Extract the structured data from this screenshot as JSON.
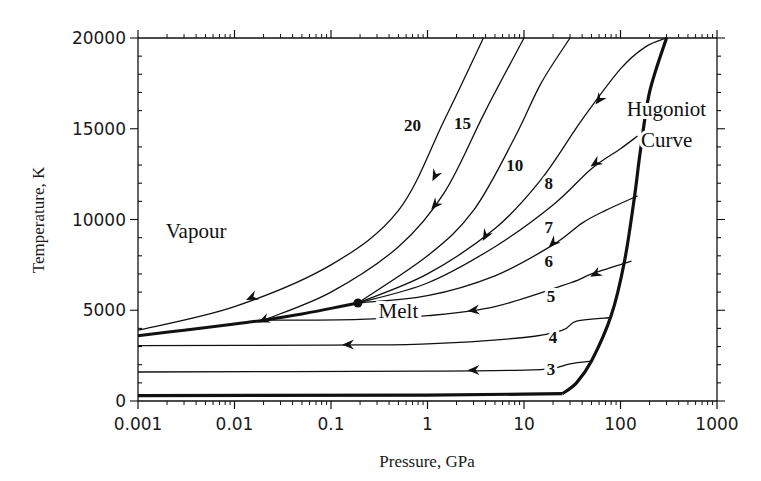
{
  "chart_data": {
    "type": "line",
    "title": "",
    "xlabel": "Pressure, GPa",
    "ylabel": "Temperature, K",
    "xscale": "log",
    "xlim": [
      0.001,
      1000
    ],
    "ylim": [
      0,
      20000
    ],
    "xticks": [
      "0.001",
      "0.01",
      "0.1",
      "1",
      "10",
      "100",
      "1000"
    ],
    "yticks": [
      "0",
      "5000",
      "10000",
      "15000",
      "20000"
    ],
    "grid": false,
    "legend": null,
    "annotations": [
      {
        "text": "Vapour",
        "x": 0.004,
        "y": 9000
      },
      {
        "text": "Melt",
        "x": 0.5,
        "y": 4600
      },
      {
        "text": "Hugoniot",
        "x": 300,
        "y": 15700
      },
      {
        "text": "Curve",
        "x": 300,
        "y": 14000
      }
    ],
    "critical_point": {
      "x": 0.19,
      "y": 5400
    },
    "hugoniot": {
      "name": "Hugoniot Curve",
      "x": [
        0.001,
        1,
        10,
        25,
        35,
        50,
        80,
        110,
        140,
        160,
        200,
        300
      ],
      "y": [
        300,
        320,
        380,
        400,
        1000,
        2200,
        4700,
        7700,
        11300,
        13700,
        17000,
        20000
      ]
    },
    "vapour_melt_boundary": {
      "name": "Phase boundary",
      "x": [
        0.001,
        0.003,
        0.01,
        0.02,
        0.05,
        0.1,
        0.19
      ],
      "y": [
        3600,
        3900,
        4250,
        4450,
        4800,
        5100,
        5400
      ]
    },
    "series": [
      {
        "name": "3",
        "x": [
          0.001,
          1,
          10,
          20,
          30,
          50
        ],
        "y": [
          1600,
          1650,
          1700,
          1800,
          2050,
          2200
        ]
      },
      {
        "name": "4",
        "x": [
          0.001,
          0.1,
          1,
          10,
          25,
          35,
          80
        ],
        "y": [
          3050,
          3080,
          3150,
          3500,
          3900,
          4400,
          4600
        ]
      },
      {
        "name": "5",
        "x": [
          0.02,
          0.2,
          1,
          5,
          30,
          50,
          130
        ],
        "y": [
          4450,
          4500,
          4700,
          5200,
          6500,
          7000,
          7700
        ]
      },
      {
        "name": "6",
        "x": [
          0.19,
          1,
          5,
          20,
          40,
          70,
          150
        ],
        "y": [
          5400,
          5800,
          6900,
          8600,
          9800,
          10500,
          11300
        ]
      },
      {
        "name": "7",
        "x": [
          0.19,
          1,
          5,
          20,
          50,
          100,
          150
        ],
        "y": [
          5400,
          6500,
          8500,
          10800,
          12800,
          13900,
          14600
        ]
      },
      {
        "name": "8",
        "x": [
          0.19,
          1,
          5,
          15,
          40,
          100,
          180,
          300
        ],
        "y": [
          5400,
          7000,
          9500,
          12200,
          15500,
          18300,
          19500,
          20000
        ]
      },
      {
        "name": "10",
        "x": [
          0.19,
          1,
          3,
          8,
          15,
          30
        ],
        "y": [
          5400,
          8000,
          10500,
          14500,
          17500,
          20000
        ]
      },
      {
        "name": "15",
        "x": [
          0.02,
          0.1,
          0.5,
          1.5,
          4,
          10
        ],
        "y": [
          4450,
          6000,
          8500,
          11500,
          16000,
          20000
        ]
      },
      {
        "name": "20",
        "x": [
          0.001,
          0.01,
          0.1,
          0.5,
          1.5,
          3.8
        ],
        "y": [
          3900,
          5200,
          7500,
          10500,
          15500,
          20000
        ]
      }
    ],
    "arrows": [
      {
        "series": "20",
        "x": 0.015,
        "y": 5700
      },
      {
        "series": "20",
        "x": 1.2,
        "y": 12400
      },
      {
        "series": "15",
        "x": 0.02,
        "y": 4450
      },
      {
        "series": "15",
        "x": 1.2,
        "y": 10800
      },
      {
        "series": "10",
        "x": 4,
        "y": 9100
      },
      {
        "series": "8",
        "x": 60,
        "y": 16600
      },
      {
        "series": "7",
        "x": 20,
        "y": 8700
      },
      {
        "series": "7",
        "x": 55,
        "y": 13100
      },
      {
        "series": "6",
        "x": 55,
        "y": 7000
      },
      {
        "series": "5",
        "x": 3,
        "y": 5000
      },
      {
        "series": "4",
        "x": 0.15,
        "y": 3100
      },
      {
        "series": "3",
        "x": 3,
        "y": 1700
      }
    ],
    "curve_labels": [
      {
        "text": "20",
        "x": 0.7,
        "y": 15200
      },
      {
        "text": "15",
        "x": 2.3,
        "y": 15300
      },
      {
        "text": "10",
        "x": 8,
        "y": 13000
      },
      {
        "text": "8",
        "x": 18,
        "y": 12000
      },
      {
        "text": "7",
        "x": 18,
        "y": 9600
      },
      {
        "text": "6",
        "x": 18,
        "y": 7700
      },
      {
        "text": "5",
        "x": 19,
        "y": 5800
      },
      {
        "text": "4",
        "x": 20,
        "y": 3500
      },
      {
        "text": "3",
        "x": 19,
        "y": 1750
      }
    ]
  }
}
